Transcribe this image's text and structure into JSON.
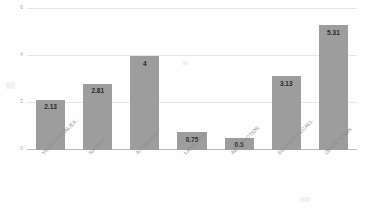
{
  "chart_data": {
    "type": "bar",
    "title": "",
    "xlabel": "",
    "ylabel": "",
    "categories": [
      "VISUOSPATIAL/EX..",
      "NAMING",
      "ATTENTION",
      "LANGUAGE",
      "ABSTRACTION",
      "DELAYED RECALL",
      "ORIENTATION"
    ],
    "values": [
      2.13,
      2.81,
      4,
      0.75,
      0.5,
      3.13,
      5.31
    ],
    "value_labels": [
      "2.13",
      "2.81",
      "4",
      "0.75",
      "0.5",
      "3.13",
      "5.31"
    ],
    "ylim": [
      0,
      6
    ],
    "yticks": [
      0,
      2,
      4,
      6
    ],
    "ytick_labels": [
      "0",
      "2",
      "4",
      "6"
    ],
    "grid": true,
    "legend": false,
    "legend_position": "none",
    "bar_color": "#9d9d9d",
    "gridline_color": "#e6e6e6",
    "axis_color": "#b9b9b9",
    "label_color": "#8d8d8d",
    "value_label_color": "#2b2b2b",
    "background": "#fefefe"
  }
}
